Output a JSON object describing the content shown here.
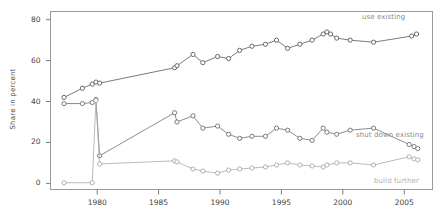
{
  "chart_data": {
    "type": "line",
    "title": "",
    "subtitle": "",
    "xlabel": "",
    "ylabel": "Share in percent",
    "xlim": [
      1976.2,
      2007.3
    ],
    "ylim": [
      -3,
      84
    ],
    "grid": false,
    "legend_position": "inline-right",
    "xticks": [
      1980,
      1985,
      1990,
      1995,
      2000,
      2005
    ],
    "xtick_labels": [
      "1980",
      "1985",
      "1990",
      "1995",
      "2000",
      "2005"
    ],
    "yticks": [
      0,
      20,
      40,
      60,
      80
    ],
    "ytick_labels": [
      "0",
      "20",
      "40",
      "60",
      "80"
    ],
    "series": [
      {
        "name": "use existing",
        "label": "use existing",
        "color": "#5a5a5a",
        "x": [
          1977.3,
          1978.8,
          1979.6,
          1979.9,
          1980.2,
          1986.3,
          1986.5,
          1987.8,
          1988.6,
          1989.8,
          1990.7,
          1991.6,
          1992.6,
          1993.7,
          1994.6,
          1995.5,
          1996.5,
          1997.5,
          1998.4,
          1998.7,
          1999.0,
          1999.5,
          2000.6,
          2002.5,
          2005.6,
          2006.0
        ],
        "values": [
          42,
          46.5,
          48.5,
          49.5,
          49,
          56.5,
          57.5,
          63,
          59,
          62,
          61,
          65,
          67,
          68,
          70,
          66,
          68,
          70,
          73,
          74,
          73,
          71,
          70,
          69,
          72,
          73
        ]
      },
      {
        "name": "shut down existing",
        "label": "shut down existing",
        "color": "#6e6e6e",
        "x": [
          1977.3,
          1978.8,
          1979.6,
          1979.9,
          1980.2,
          1986.3,
          1986.5,
          1987.8,
          1988.6,
          1989.8,
          1990.7,
          1991.6,
          1992.6,
          1993.7,
          1994.6,
          1995.5,
          1996.5,
          1997.5,
          1998.4,
          1998.7,
          1999.5,
          2000.6,
          2002.5,
          2005.4,
          2005.8,
          2006.1
        ],
        "values": [
          39,
          39,
          39.5,
          41,
          13.5,
          34.5,
          30,
          33,
          27,
          28,
          24,
          22,
          23,
          23,
          27,
          26,
          22,
          21,
          27,
          25,
          24,
          26,
          27,
          19,
          18,
          17
        ]
      },
      {
        "name": "build further",
        "label": "build further",
        "color": "#a8a8a8",
        "x": [
          1977.3,
          1979.6,
          1979.9,
          1980.2,
          1986.3,
          1986.5,
          1987.8,
          1988.6,
          1989.8,
          1990.7,
          1991.6,
          1992.6,
          1993.7,
          1994.6,
          1995.5,
          1996.5,
          1997.5,
          1998.4,
          1998.7,
          1999.5,
          2000.6,
          2002.5,
          2005.4,
          2005.8,
          2006.1
        ],
        "values": [
          0.3,
          0.3,
          40.5,
          9.5,
          11,
          10.5,
          7,
          6,
          5,
          6.5,
          7,
          7.5,
          8,
          9,
          10,
          9,
          8.5,
          8,
          9,
          10,
          10,
          9,
          13,
          12,
          11.5
        ]
      }
    ]
  }
}
